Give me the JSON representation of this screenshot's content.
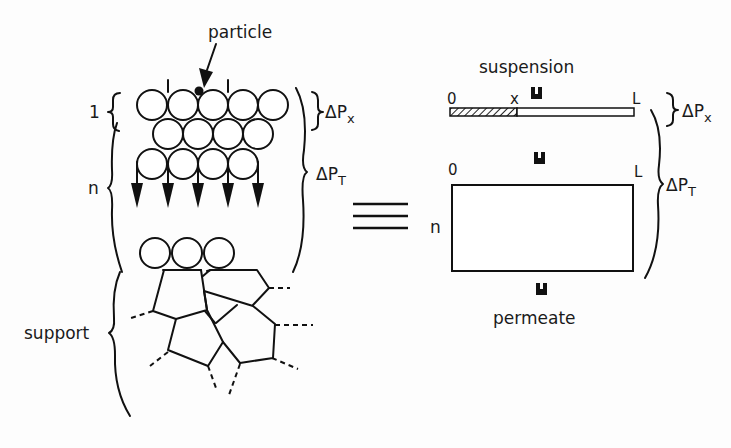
{
  "left_model": {
    "particle_label": "particle",
    "layer_one_label": "1",
    "layer_n_label": "n",
    "support_label": "support",
    "delta_px": {
      "delta": "ΔP",
      "sub": "x"
    },
    "delta_pt": {
      "delta": "ΔP",
      "sub": "T"
    },
    "rows": [
      {
        "y": 105,
        "xs": [
          152,
          183,
          213,
          243,
          273
        ]
      },
      {
        "y": 134,
        "xs": [
          168,
          198,
          228,
          258
        ]
      },
      {
        "y": 164,
        "xs": [
          152,
          183,
          213,
          243
        ]
      }
    ],
    "arrows_x": [
      137,
      168,
      198,
      228,
      258
    ],
    "support_circles_x": [
      155,
      187,
      219
    ],
    "support_circles_y": 253
  },
  "equivalence_symbol": "≡",
  "right_model": {
    "suspension_label": "suspension",
    "permeate_label": "permeate",
    "cake_bar": {
      "start_label": "0",
      "x_label": "x",
      "end_label": "L"
    },
    "bed_box": {
      "start_label": "0",
      "end_label": "L",
      "n_label": "n"
    },
    "delta_px": {
      "delta": "ΔP",
      "sub": "x"
    },
    "delta_pt": {
      "delta": "ΔP",
      "sub": "T"
    }
  }
}
